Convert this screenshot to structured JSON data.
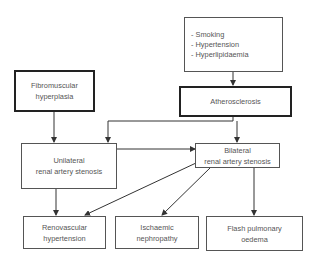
{
  "diagram": {
    "nodes": {
      "risk_factors": {
        "items": [
          "- Smoking",
          "- Hypertension",
          "- Hyperlipidaemia"
        ]
      },
      "atherosclerosis": {
        "line1": "Atherosclerosis"
      },
      "fibromuscular": {
        "line1": "Fibromuscular",
        "line2": "hyperplasia"
      },
      "unilateral": {
        "line1": "Unilateral",
        "line2": "renal artery stenosis"
      },
      "bilateral": {
        "line1": "Bilateral",
        "line2": "renal artery stenosis"
      },
      "renovascular": {
        "line1": "Renovascular",
        "line2": "hypertension"
      },
      "ischaemic": {
        "line1": "Ischaemic",
        "line2": "nephropathy"
      },
      "flash": {
        "line1": "Flash pulmonary",
        "line2": "oedema"
      }
    },
    "edges": [
      {
        "from": "risk_factors",
        "to": "atherosclerosis"
      },
      {
        "from": "atherosclerosis",
        "to": "unilateral"
      },
      {
        "from": "atherosclerosis",
        "to": "bilateral"
      },
      {
        "from": "fibromuscular",
        "to": "unilateral"
      },
      {
        "from": "unilateral",
        "to": "bilateral"
      },
      {
        "from": "unilateral",
        "to": "renovascular"
      },
      {
        "from": "bilateral",
        "to": "renovascular"
      },
      {
        "from": "bilateral",
        "to": "ischaemic"
      },
      {
        "from": "bilateral",
        "to": "flash"
      }
    ],
    "colors": {
      "line": "#333333",
      "text": "#555555",
      "thick_border": "#222222"
    }
  }
}
